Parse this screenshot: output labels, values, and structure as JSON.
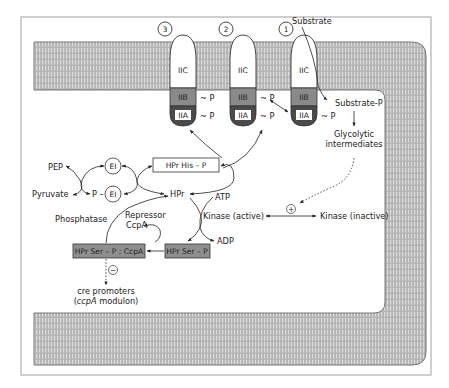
{
  "diagram": {
    "colors": {
      "membrane_fill": "#b8b8b8",
      "membrane_stripe": "#d6d6d6",
      "membrane_edge": "#6a6a6a",
      "iib_fill": "#8a8a8a",
      "iia_fill": "#4a4a4a",
      "gray_box_fill": "#8f8f8f",
      "frame": "#9a9a9a",
      "line": "#2a2a2a"
    },
    "transporters": [
      {
        "number": "3",
        "iic": "IIC",
        "iib": "IIB",
        "iia": "IIA",
        "iib_p": "~ P",
        "iia_p": "~ P"
      },
      {
        "number": "2",
        "iic": "IIC",
        "iib": "IIB",
        "iia": "IIA",
        "iib_p": "~ P",
        "iia_p": "~ P"
      },
      {
        "number": "1",
        "iic": "IIC",
        "iib": "IIB",
        "iia": "IIA",
        "iib_p": "",
        "iia_p": "~ P"
      }
    ],
    "labels": {
      "substrate": "Substrate",
      "substrate_p": "Substrate-P",
      "glycolytic_1": "Glycolytic",
      "glycolytic_2": "intermediates",
      "pep": "PEP",
      "pyruvate": "Pyruvate",
      "ei": "EI",
      "p_ei_prefix": "P –",
      "hpr_his_p": "HPr His – P",
      "hpr": "HPr",
      "atp": "ATP",
      "adp": "ADP",
      "kinase_active": "Kinase (active)",
      "kinase_inactive": "Kinase (inactive)",
      "plus": "+",
      "phosphatase": "Phosphatase",
      "repressor_1": "Repressor",
      "repressor_2": "CcpA",
      "hpr_ser_p_ccpa": "HPr Ser – P : CcpA",
      "hpr_ser_p": "HPr Ser – P",
      "minus": "−",
      "cre_1": "cre promoters",
      "cre_2_open": "(",
      "cre_2_italic": "ccpA",
      "cre_2_rest": " modulon)"
    }
  }
}
